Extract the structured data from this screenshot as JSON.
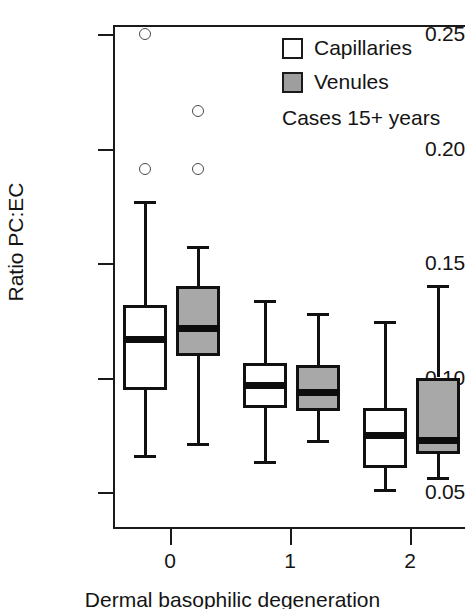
{
  "chart_data": {
    "type": "box",
    "title": "",
    "xlabel": "Dermal basophilic degeneration",
    "ylabel": "Ratio PC:EC",
    "ylim": [
      0.035,
      0.262
    ],
    "yticks": [
      "0.05",
      "0.10",
      "0.15",
      "0.20",
      "0.25"
    ],
    "ytick_values": [
      0.05,
      0.1,
      0.15,
      0.2,
      0.25
    ],
    "categories": [
      "0",
      "1",
      "2"
    ],
    "grid": false,
    "legend_position": "top-right",
    "annotation": "Cases 15+ years",
    "legend": [
      {
        "label": "Capillaries",
        "fill": "#ffffff",
        "swatch": "sw-white"
      },
      {
        "label": "Venules",
        "fill": "#9e9e9e",
        "swatch": "sw-gray"
      }
    ],
    "series": [
      {
        "name": "Capillaries",
        "fill": "#ffffff",
        "boxes": [
          {
            "category": "0",
            "whisker_low": 0.066,
            "q1": 0.0945,
            "median": 0.1165,
            "q3": 0.1315,
            "whisker_high": 0.177,
            "outliers": [
              0.25,
              0.191
            ]
          },
          {
            "category": "1",
            "whisker_low": 0.0635,
            "q1": 0.0865,
            "median": 0.0965,
            "q3": 0.1065,
            "whisker_high": 0.134,
            "outliers": []
          },
          {
            "category": "2",
            "whisker_low": 0.0515,
            "q1": 0.0605,
            "median": 0.0745,
            "q3": 0.0865,
            "whisker_high": 0.1245,
            "outliers": []
          }
        ]
      },
      {
        "name": "Venules",
        "fill": "#a8a8a8",
        "boxes": [
          {
            "category": "0",
            "whisker_low": 0.0715,
            "q1": 0.1095,
            "median": 0.1215,
            "q3": 0.14,
            "whisker_high": 0.1575,
            "outliers": [
              0.2165,
              0.191
            ]
          },
          {
            "category": "1",
            "whisker_low": 0.0725,
            "q1": 0.0855,
            "median": 0.0935,
            "q3": 0.1055,
            "whisker_high": 0.128,
            "outliers": []
          },
          {
            "category": "2",
            "whisker_low": 0.0565,
            "q1": 0.0665,
            "median": 0.0725,
            "q3": 0.1,
            "whisker_high": 0.1405,
            "outliers": []
          }
        ]
      }
    ]
  },
  "axis": {
    "y_title": "Ratio PC:EC",
    "x_title": "Dermal basophilic degeneration",
    "y_labels": [
      "0.25",
      "0.20",
      "0.15",
      "0.10",
      "0.05"
    ],
    "x_labels": [
      "0",
      "1",
      "2"
    ]
  },
  "legend": {
    "capillaries_label": "Capillaries",
    "venules_label": "Venules",
    "note": "Cases 15+ years"
  }
}
